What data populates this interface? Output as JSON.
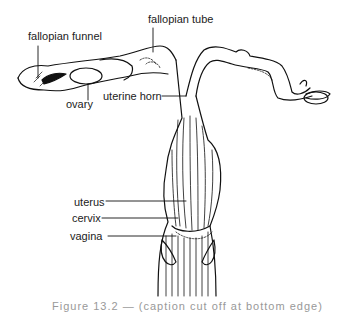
{
  "diagram": {
    "type": "anatomical-line-drawing",
    "labels": [
      {
        "id": "fallopian_funnel",
        "text": "fallopian funnel"
      },
      {
        "id": "fallopian_tube",
        "text": "fallopian tube"
      },
      {
        "id": "ovary",
        "text": "ovary"
      },
      {
        "id": "uterine_horn",
        "text": "uterine horn"
      },
      {
        "id": "uterus",
        "text": "uterus"
      },
      {
        "id": "cervix",
        "text": "cervix"
      },
      {
        "id": "vagina",
        "text": "vagina"
      }
    ],
    "caption": "Figure 13.2 — (caption cut off at bottom edge)",
    "colors": {
      "ink": "#111111",
      "label": "#222222",
      "background": "#ffffff"
    }
  }
}
